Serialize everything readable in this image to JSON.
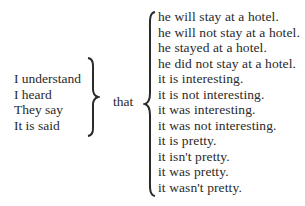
{
  "left_phrases": [
    "I understand",
    "I heard",
    "They say",
    "It is said"
  ],
  "connector": "that",
  "right_clauses": [
    "he will stay at a hotel.",
    "he will not stay at a hotel.",
    "he stayed at a hotel.",
    "he did not stay at a hotel.",
    "it is interesting.",
    "it is not interesting.",
    "it was interesting.",
    "it was not interesting.",
    "it is pretty.",
    "it isn't pretty.",
    "it was pretty.",
    "it wasn't pretty."
  ]
}
